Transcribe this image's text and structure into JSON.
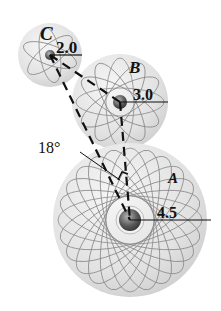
{
  "figure": {
    "gears": [
      {
        "label": "A",
        "value": "4.5",
        "cx": 130,
        "cy": 220,
        "r": 77
      },
      {
        "label": "B",
        "value": "3.0",
        "cx": 120,
        "cy": 102,
        "r": 48
      },
      {
        "label": "C",
        "value": "2.0",
        "cx": 50,
        "cy": 55,
        "r": 32
      }
    ],
    "angle_label": "18°",
    "colors": {
      "sphere_fill": "#e4e4e4",
      "orbit": "#8a8a8a",
      "line": "#111111"
    }
  }
}
